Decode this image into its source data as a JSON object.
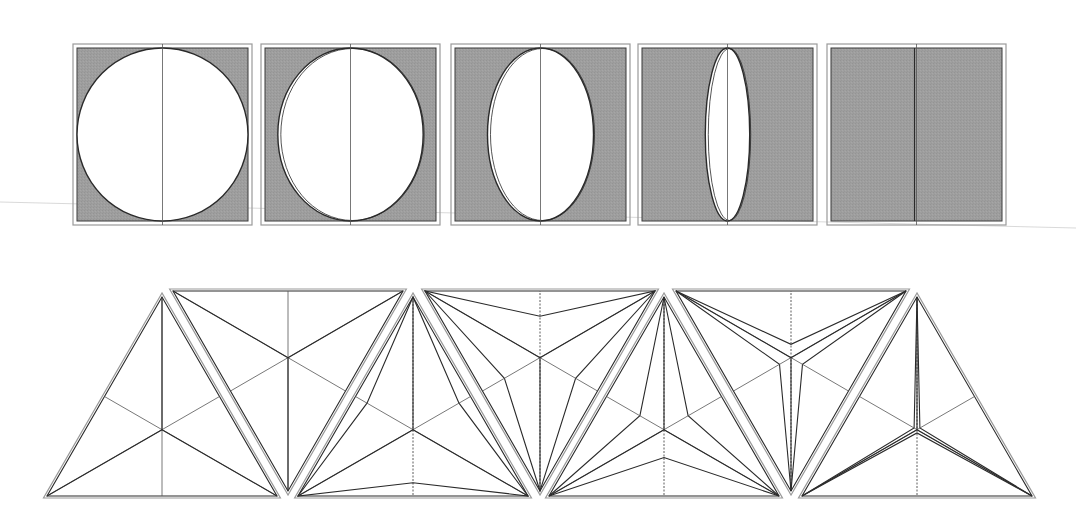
{
  "colors": {
    "background": "#ffffff",
    "fill_shaded": "#9e9e9e",
    "fill_light": "#ffffff",
    "stroke_dark": "#2a2a2a",
    "frame_light": "#9a9a9a"
  },
  "top_row": {
    "description": "Ellipse inscribed in a square frame, flattening horizontally from circle to line",
    "frame_y": 44,
    "frame_height": 181,
    "frame_width": 179,
    "inset": 4,
    "squares": [
      {
        "id": "square-1",
        "x": 73,
        "ellipse_rx_ratio": 1.0,
        "shaded": true
      },
      {
        "id": "square-2",
        "x": 261,
        "ellipse_rx_ratio": 0.85,
        "shaded": true
      },
      {
        "id": "square-3",
        "x": 451,
        "ellipse_rx_ratio": 0.62,
        "shaded": true
      },
      {
        "id": "square-4",
        "x": 638,
        "ellipse_rx_ratio": 0.26,
        "shaded": true
      },
      {
        "id": "square-5",
        "x": 827,
        "ellipse_rx_ratio": 0.0,
        "shaded": true
      }
    ]
  },
  "bottom_row": {
    "description": "Equilateral triangles with inscribed three-armed star; the white star arms thin out from full triangle to thin spokes",
    "apex_y": 297,
    "base_y": 496,
    "inv_top_y": 291,
    "inv_bottom_y": 491,
    "half_width": 115,
    "triangles": [
      {
        "id": "triangle-1",
        "cx": 162,
        "inverted": false,
        "star_ratio": 1.0
      },
      {
        "id": "triangle-2",
        "cx": 288,
        "inverted": true,
        "star_ratio": 1.0
      },
      {
        "id": "triangle-3",
        "cx": 413,
        "inverted": false,
        "star_ratio": 0.8
      },
      {
        "id": "triangle-4",
        "cx": 540,
        "inverted": true,
        "star_ratio": 0.62
      },
      {
        "id": "triangle-5",
        "cx": 664,
        "inverted": false,
        "star_ratio": 0.42
      },
      {
        "id": "triangle-6",
        "cx": 791,
        "inverted": true,
        "star_ratio": 0.2
      },
      {
        "id": "triangle-7",
        "cx": 917,
        "inverted": false,
        "star_ratio": 0.05
      }
    ]
  }
}
